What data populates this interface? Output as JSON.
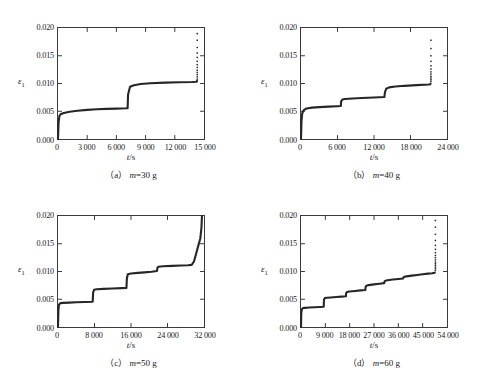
{
  "figure": {
    "ylabel": "ε",
    "ylabel_sub": "1",
    "xlabel_italic": "t",
    "xlabel_unit": "/s",
    "yticks": [
      "0.000",
      "0.005",
      "0.010",
      "0.015",
      "0.020"
    ],
    "ytick_values": [
      0.0,
      0.005,
      0.01,
      0.015,
      0.02
    ],
    "ylim": [
      0,
      0.02
    ],
    "curve_color": "#262626",
    "axis_color": "#3a3a3a",
    "background": "#ffffff"
  },
  "chart_data": [
    {
      "id": "a",
      "type": "line",
      "title": "（a）",
      "caption_prefix": "（a）",
      "caption_var": "m",
      "caption_value": "=30 g",
      "caption": "（a） m=30 g",
      "xlabel": "t/s",
      "ylabel": "ε1",
      "xlim": [
        0,
        15000
      ],
      "ylim": [
        0,
        0.02
      ],
      "xticks": [
        0,
        3000,
        6000,
        9000,
        12000,
        15000
      ],
      "xticklabels": [
        "0",
        "3 000",
        "6 000",
        "9 000",
        "12 000",
        "15 000"
      ],
      "grid": false,
      "legend": "none",
      "series": [
        {
          "name": "creep-strain",
          "x": [
            0,
            60,
            150,
            300,
            600,
            1200,
            2000,
            3000,
            4000,
            5000,
            6000,
            7000,
            7150,
            7200,
            7400,
            7800,
            8500,
            9500,
            11000,
            12500,
            13800,
            14250,
            14280
          ],
          "y": [
            0.0,
            0.003,
            0.0042,
            0.0045,
            0.0047,
            0.0049,
            0.0051,
            0.00525,
            0.00535,
            0.00543,
            0.00548,
            0.00553,
            0.00556,
            0.008,
            0.0094,
            0.0097,
            0.0099,
            0.01005,
            0.01015,
            0.01022,
            0.01028,
            0.01032,
            0.0105
          ]
        }
      ],
      "failure_scatter": {
        "x": 14300,
        "y_values": [
          0.0108,
          0.0112,
          0.0116,
          0.012,
          0.0124,
          0.0129,
          0.0134,
          0.014,
          0.0147,
          0.0155,
          0.0165,
          0.0178,
          0.019
        ]
      }
    },
    {
      "id": "b",
      "type": "line",
      "title": "（b）",
      "caption_prefix": "（b）",
      "caption_var": "m",
      "caption_value": "=40 g",
      "caption": "（b） m=40 g",
      "xlabel": "t/s",
      "ylabel": "ε1",
      "xlim": [
        0,
        24000
      ],
      "ylim": [
        0,
        0.02
      ],
      "xticks": [
        0,
        6000,
        12000,
        18000,
        24000
      ],
      "xticklabels": [
        "0",
        "6 000",
        "12 000",
        "18 000",
        "24 000"
      ],
      "grid": false,
      "legend": "none",
      "series": [
        {
          "name": "creep-strain",
          "x": [
            0,
            80,
            200,
            450,
            900,
            1800,
            3000,
            4500,
            6000,
            6550,
            6600,
            6800,
            7200,
            8500,
            10000,
            12000,
            13700,
            13800,
            14000,
            14500,
            15500,
            17000,
            19000,
            21000,
            21250,
            21300
          ],
          "y": [
            0.0,
            0.0032,
            0.0046,
            0.0052,
            0.0055,
            0.00565,
            0.00575,
            0.00583,
            0.0059,
            0.00594,
            0.0068,
            0.0071,
            0.0072,
            0.0073,
            0.00738,
            0.00748,
            0.00756,
            0.0084,
            0.00905,
            0.0093,
            0.00945,
            0.00958,
            0.0097,
            0.00982,
            0.00988,
            0.01
          ]
        }
      ],
      "failure_scatter": {
        "x": 21350,
        "y_values": [
          0.0104,
          0.0107,
          0.011,
          0.0113,
          0.0117,
          0.0121,
          0.0126,
          0.0132,
          0.014,
          0.015,
          0.0163,
          0.0178
        ]
      }
    },
    {
      "id": "c",
      "type": "line",
      "title": "（c）",
      "caption_prefix": "（c）",
      "caption_var": "m",
      "caption_value": "=50 g",
      "caption": "（c） m=50 g",
      "xlabel": "t/s",
      "ylabel": "ε1",
      "xlim": [
        0,
        32000
      ],
      "ylim": [
        0,
        0.02
      ],
      "xticks": [
        0,
        8000,
        16000,
        24000,
        32000
      ],
      "xticklabels": [
        "0",
        "8 000",
        "16 000",
        "24 000",
        "32 000"
      ],
      "grid": false,
      "legend": "none",
      "series": [
        {
          "name": "creep-strain",
          "x": [
            0,
            80,
            200,
            500,
            1200,
            2500,
            4000,
            6000,
            7600,
            7700,
            7900,
            8500,
            10000,
            12000,
            14000,
            15000,
            15100,
            15300,
            16000,
            17500,
            19000,
            20500,
            21700,
            21800,
            22000,
            23000,
            25000,
            27000,
            28500,
            29300,
            29800,
            30300,
            30800,
            31200,
            31450,
            31550
          ],
          "y": [
            0.0,
            0.0028,
            0.004,
            0.0043,
            0.00435,
            0.0044,
            0.00445,
            0.0045,
            0.00455,
            0.0062,
            0.0067,
            0.0068,
            0.00687,
            0.00693,
            0.007,
            0.00705,
            0.0088,
            0.0095,
            0.00965,
            0.00975,
            0.00985,
            0.00995,
            0.0101,
            0.0107,
            0.01085,
            0.01095,
            0.01102,
            0.01108,
            0.01112,
            0.0112,
            0.0118,
            0.0133,
            0.0148,
            0.016,
            0.018,
            0.02
          ]
        }
      ],
      "failure_scatter": null
    },
    {
      "id": "d",
      "type": "line",
      "title": "（d）",
      "caption_prefix": "（d）",
      "caption_var": "m",
      "caption_value": "=60 g",
      "caption": "（d） m=60 g",
      "xlabel": "t/s",
      "ylabel": "ε1",
      "xlim": [
        0,
        54000
      ],
      "ylim": [
        0,
        0.02
      ],
      "xticks": [
        0,
        9000,
        18000,
        27000,
        36000,
        45000,
        54000
      ],
      "xticklabels": [
        "0",
        "9 000",
        "18 000",
        "27 000",
        "36 000",
        "45 000",
        "54 000"
      ],
      "grid": false,
      "legend": "none",
      "series": [
        {
          "name": "creep-strain",
          "x": [
            0,
            100,
            300,
            700,
            1500,
            3000,
            5000,
            7000,
            8400,
            8500,
            8800,
            9500,
            11000,
            13000,
            15000,
            16600,
            16700,
            17000,
            18000,
            20000,
            22000,
            23800,
            23900,
            24200,
            25000,
            27000,
            29000,
            30800,
            30900,
            31200,
            32000,
            34000,
            36000,
            37800,
            37900,
            38200,
            39000,
            41000,
            43000,
            45000,
            47000,
            48500,
            49300,
            49500
          ],
          "y": [
            0.0,
            0.0025,
            0.0032,
            0.0034,
            0.00345,
            0.0035,
            0.00355,
            0.0036,
            0.00365,
            0.0049,
            0.0052,
            0.00527,
            0.00533,
            0.0054,
            0.00547,
            0.00553,
            0.0061,
            0.0063,
            0.0064,
            0.0065,
            0.0066,
            0.00668,
            0.0072,
            0.00745,
            0.00755,
            0.00768,
            0.0078,
            0.0079,
            0.0082,
            0.00835,
            0.00843,
            0.00855,
            0.00865,
            0.00873,
            0.00895,
            0.00905,
            0.00912,
            0.00925,
            0.00938,
            0.0095,
            0.00962,
            0.0097,
            0.00975,
            0.0098
          ]
        }
      ],
      "failure_scatter": {
        "x": 49700,
        "y_values": [
          0.0102,
          0.0105,
          0.0108,
          0.0111,
          0.0114,
          0.0117,
          0.0121,
          0.0125,
          0.0129,
          0.0134,
          0.014,
          0.0147,
          0.0156,
          0.0167,
          0.018,
          0.0192
        ]
      }
    }
  ]
}
